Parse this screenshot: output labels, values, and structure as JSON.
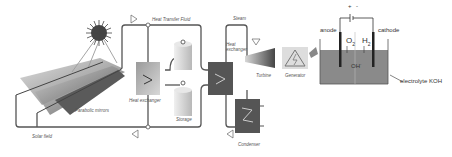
{
  "diagram": {
    "labels": {
      "heat_transfer_fluid": "Heat Transfer Fluid",
      "steam": "Steam",
      "heat_exchanger_1": "Heat exchanger",
      "heat_exchanger_2": "Heat exchanger",
      "parabolic_mirrors": "Parabolic mirrors",
      "solar_field": "Solar field",
      "storage": "Storage",
      "turbine": "Turbine",
      "generator": "Generator",
      "condenser": "Condenser",
      "anode": "anode",
      "cathode": "cathode",
      "o2": "O",
      "o2_sub": "2",
      "h2": "H",
      "h2_sub": "2",
      "oh": "OH",
      "oh_sup": "-",
      "electrolyte": "electrolyte KOH",
      "plus": "+",
      "minus": "-"
    },
    "colors": {
      "pipe": "#555555",
      "electrolyte": "#8a8a8a",
      "mirror_dark": "#555555",
      "mirror_light": "#bdbdbd",
      "exchanger": "#666666"
    }
  }
}
